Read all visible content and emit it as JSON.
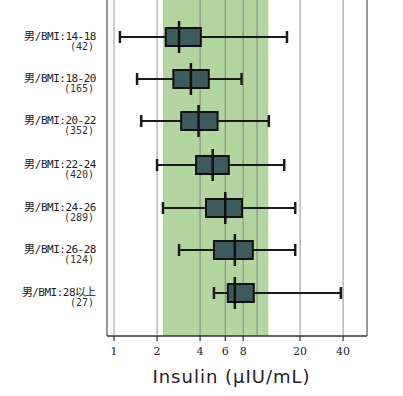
{
  "chart_data": {
    "type": "boxplot",
    "orientation": "horizontal",
    "xlabel": "Insulin (μIU/mL)",
    "xscale": "log",
    "xlim": [
      0.95,
      60
    ],
    "xticks": [
      1,
      2,
      4,
      6,
      8,
      20,
      40
    ],
    "xtick_labels": [
      "1",
      "2",
      "4",
      "6",
      "8",
      "20",
      "40"
    ],
    "gridlines_x": [
      2,
      4,
      6,
      8,
      10,
      20,
      40
    ],
    "reference_band": {
      "from": 2.2,
      "to": 12,
      "color": "#a6cf8f"
    },
    "box_color": "#3d5a5c",
    "categories": [
      {
        "label": "男/BMI:14-18",
        "n": "(42)",
        "whisker_low": 1.1,
        "q1": 2.3,
        "median": 2.85,
        "q3": 4.05,
        "whisker_high": 16.2
      },
      {
        "label": "男/BMI:18-20",
        "n": "(165)",
        "whisker_low": 1.45,
        "q1": 2.6,
        "median": 3.45,
        "q3": 4.6,
        "whisker_high": 7.8
      },
      {
        "label": "男/BMI:20-22",
        "n": "(352)",
        "whisker_low": 1.55,
        "q1": 2.95,
        "median": 3.9,
        "q3": 5.3,
        "whisker_high": 12.1
      },
      {
        "label": "男/BMI:22-24",
        "n": "(420)",
        "whisker_low": 2.0,
        "q1": 3.75,
        "median": 4.9,
        "q3": 6.35,
        "whisker_high": 15.5
      },
      {
        "label": "男/BMI:24-26",
        "n": "(289)",
        "whisker_low": 2.2,
        "q1": 4.4,
        "median": 6.0,
        "q3": 7.85,
        "whisker_high": 18.5
      },
      {
        "label": "男/BMI:26-28",
        "n": "(124)",
        "whisker_low": 2.85,
        "q1": 5.0,
        "median": 7.0,
        "q3": 9.35,
        "whisker_high": 18.5
      },
      {
        "label": "男/BMI:28以上",
        "n": "(27)",
        "whisker_low": 5.0,
        "q1": 6.25,
        "median": 7.0,
        "q3": 9.5,
        "whisker_high": 38.6
      }
    ],
    "grid": true,
    "legend": null
  },
  "layout": {
    "plot_left": 107,
    "plot_right": 367,
    "plot_bottom": 336,
    "plot_top": 0,
    "x_origin_px": 114,
    "px_per_decade": 143,
    "row_y": [
      37,
      79,
      121,
      165,
      208,
      250,
      293
    ]
  }
}
